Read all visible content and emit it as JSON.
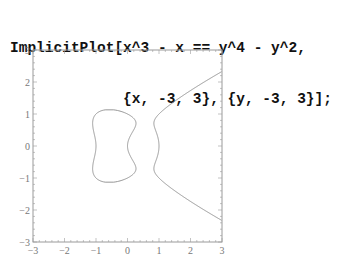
{
  "input": {
    "line1": "ImplicitPlot[x^3 - x == y^4 - y^2,",
    "line2": "             {x, -3, 3}, {y, -3, 3}];"
  },
  "chart_data": {
    "type": "line",
    "title": "",
    "equation": "x^3 - x == y^4 - y^2",
    "xlabel": "",
    "ylabel": "",
    "xlim": [
      -3,
      3
    ],
    "ylim": [
      -3,
      3
    ],
    "x_ticks": [
      "-3",
      "-2",
      "-1",
      "0",
      "1",
      "2",
      "3"
    ],
    "y_ticks": [
      "3",
      "2",
      "1",
      "0",
      "-1",
      "-2",
      "-3"
    ],
    "grid": false,
    "legend": null,
    "series": [
      {
        "name": "closed oval",
        "description": "bounded component, x in approx [-1.15, 0.25], y in approx [-1.1, 1.1]"
      },
      {
        "name": "open branch",
        "description": "unbounded component starting near x=0.75, opening to the right, reaching (3, ±2.35)"
      }
    ],
    "colors": {
      "curve": "#8a8a8a",
      "frame": "#9a9a9a",
      "labels": "#777777"
    }
  }
}
